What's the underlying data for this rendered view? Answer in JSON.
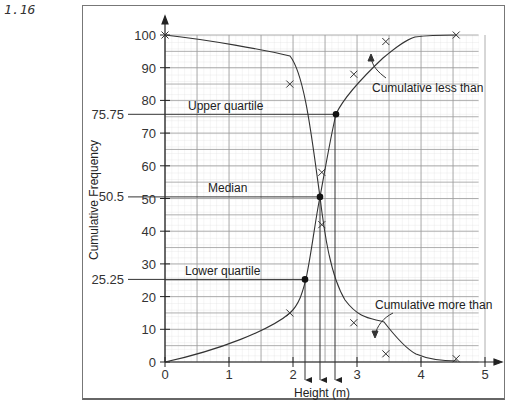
{
  "figure_number": "1.16",
  "chart_data": {
    "type": "line",
    "title": "",
    "xlabel": "Height (m)",
    "ylabel": "Cumulative Frequency",
    "xlim": [
      0,
      5
    ],
    "ylim": [
      0,
      100
    ],
    "xticks": [
      0,
      1,
      2,
      3,
      4,
      5
    ],
    "yticks": [
      0,
      10,
      20,
      30,
      40,
      50,
      60,
      70,
      80,
      90,
      100
    ],
    "grid": true,
    "series": [
      {
        "name": "Cumulative less than",
        "x": [
          0,
          1.95,
          2.45,
          2.95,
          3.45,
          4.55
        ],
        "y": [
          0,
          15,
          58,
          88,
          98,
          100
        ]
      },
      {
        "name": "Cumulative more than",
        "x": [
          0,
          1.95,
          2.45,
          2.95,
          3.45,
          4.55
        ],
        "y": [
          100,
          85,
          42,
          12,
          2.5,
          1
        ]
      }
    ],
    "annotations": [
      {
        "label": "Upper quartile",
        "y": 75.75,
        "y_label": "75.75",
        "x": 2.66
      },
      {
        "label": "Median",
        "y": 50.5,
        "y_label": "50.5",
        "x": 2.42
      },
      {
        "label": "Lower quartile",
        "y": 25.25,
        "y_label": "25.25",
        "x": 2.19
      }
    ],
    "curve_labels": [
      "Cumulative less than",
      "Cumulative more than"
    ]
  },
  "labels": {
    "xlabel": "Height (m)",
    "ylabel": "Cumulative Frequency",
    "upper_quartile": "Upper quartile",
    "median": "Median",
    "lower_quartile": "Lower quartile",
    "uq_value": "75.75",
    "median_value": "50.5",
    "lq_value": "25.25",
    "less_than": "Cumulative less than",
    "more_than": "Cumulative more than",
    "xticks": [
      "0",
      "1",
      "2",
      "3",
      "4",
      "5"
    ],
    "yticks": [
      "0",
      "10",
      "20",
      "30",
      "40",
      "50",
      "60",
      "70",
      "80",
      "90",
      "100"
    ]
  }
}
